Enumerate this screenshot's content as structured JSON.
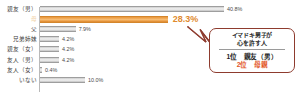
{
  "chart_data": {
    "type": "bar",
    "orientation": "horizontal",
    "title": "",
    "xlabel": "",
    "ylabel": "",
    "xlim": [
      0,
      45
    ],
    "grid": false,
    "legend": false,
    "categories": [
      "親友（男）",
      "母",
      "父",
      "兄弟姉妹",
      "親友（女）",
      "友人（男）",
      "友人（女）",
      "いない"
    ],
    "values": [
      40.8,
      28.3,
      7.9,
      4.2,
      4.2,
      4.2,
      0.4,
      10.0
    ],
    "value_labels": [
      "40.8%",
      "28.3%",
      "7.9%",
      "4.2%",
      "4.2%",
      "4.2%",
      "0.4%",
      "10.0%"
    ],
    "highlight_index": 1,
    "colors": {
      "bar": "#dcdcdc",
      "bar_border": "#9e9e9e",
      "highlight_bar": "#eda14a",
      "highlight_text": "#e08a2e",
      "axis": "#b9b9b9",
      "label": "#3a3a3a"
    }
  },
  "callout": {
    "title_line1": "イマドキ男子が",
    "title_line2": "心を許す人",
    "rank1": "1位　親友（男）",
    "rank2": "2位　母親",
    "border_color": "#8e3b2e",
    "rank2_color": "#e2561f"
  }
}
